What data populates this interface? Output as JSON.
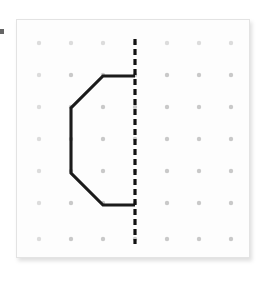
{
  "figure": {
    "panel": {
      "background_color": "#fdfdfd",
      "border_color": "#e3e3e3",
      "x": 16,
      "y": 19,
      "width": 234,
      "height": 239
    },
    "grid": {
      "columns": 7,
      "rows": 7,
      "spacing": 32,
      "origin_x": 38,
      "origin_y": 42,
      "dot_radius": 2.2,
      "dot_color": "#c9c9c9",
      "columns_x": [
        38,
        70,
        102,
        134,
        166,
        198,
        230
      ],
      "rows_y": [
        42,
        74,
        106,
        138,
        170,
        202,
        238
      ]
    },
    "mirror_line": {
      "name": "line-of-symmetry",
      "orientation": "vertical",
      "color": "#121212",
      "stroke_width": 3.2,
      "dash_pattern": "6 4",
      "x": 134,
      "y_start": 38,
      "y_end": 243
    },
    "shape": {
      "name": "half-hexagon-outline",
      "color": "#1b1b1b",
      "stroke_width": 3.1,
      "closed": false,
      "vertices": [
        {
          "x": 134,
          "y": 75
        },
        {
          "x": 102,
          "y": 75
        },
        {
          "x": 70,
          "y": 107
        },
        {
          "x": 70,
          "y": 172
        },
        {
          "x": 102,
          "y": 204
        },
        {
          "x": 134,
          "y": 204
        }
      ],
      "vertex_count": 6,
      "segment_count": 5
    },
    "edge_speck": {
      "name": "edge-speck",
      "color": "#4a4a4a",
      "x": 0,
      "y": 29,
      "width": 4,
      "height": 5
    }
  }
}
